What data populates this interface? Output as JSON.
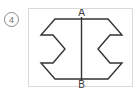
{
  "item": {
    "number": "4",
    "marker_style": "circled"
  },
  "figure": {
    "title": "",
    "labels": {
      "top_vertex": "A",
      "bottom_vertex": "B"
    },
    "axis_line": {
      "name": "AB",
      "orientation": "vertical",
      "from": "A",
      "to": "B"
    },
    "colors": {
      "outline": "#333333",
      "axis": "#333333",
      "frame": "#d9d9d9",
      "background": "#ffffff",
      "marker": "#6f6f6f"
    },
    "geometry": {
      "viewbox": "0 0 105 79",
      "left_half_points": "52,10 26,10 12,26 24,26 36,40 24,54 12,54 26,70 52,70",
      "right_half_points": "53,10 79,10 93,26 81,26 69,40 81,54 93,54 79,70 53,70",
      "axis_x": 52.5,
      "axis_y_top": 8,
      "axis_y_bottom": 72,
      "label_a_x": 52.5,
      "label_a_y": 7,
      "label_b_x": 52.5,
      "label_b_y": 79
    }
  }
}
